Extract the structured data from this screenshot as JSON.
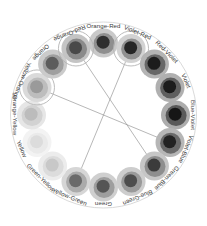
{
  "widget": {
    "name": "color-wheel",
    "type": "grayscale-color-harmony-wheel",
    "background": "#ffffff",
    "center": {
      "x": 103.5,
      "y": 115
    },
    "outer_ring_radius": 93,
    "swatch_ring_radius": 72,
    "label_radius": 89,
    "swatch_outer_radius": 14.5,
    "swatch_mid_radius": 10.5,
    "swatch_inner_radius": 6.5,
    "selection_ring_radius": 17.5,
    "selection_ring_color": "#b4b4b4",
    "outer_ring_color": "#cfcfcf",
    "connector_color": "#8a8a8a"
  },
  "swatches": [
    {
      "label": "Orange-Red",
      "angle": -90,
      "outer": "#c9c9c9",
      "mid": "#8f8f8f",
      "inner": "#2e2e2e",
      "selected": false
    },
    {
      "label": "Violet-Red",
      "angle": -67.5,
      "outer": "#d2d2d2",
      "mid": "#909090",
      "inner": "#252525",
      "selected": true
    },
    {
      "label": "Red-Violet",
      "angle": -45,
      "outer": "#b4b4b4",
      "mid": "#686868",
      "inner": "#1f1f1f",
      "selected": false
    },
    {
      "label": "Violet",
      "angle": -22.5,
      "outer": "#b0b0b0",
      "mid": "#5e5e5e",
      "inner": "#1a1a1a",
      "selected": false
    },
    {
      "label": "Blue-Violet",
      "angle": 0,
      "outer": "#adadad",
      "mid": "#5a5a5a",
      "inner": "#171717",
      "selected": false
    },
    {
      "label": "Violet-Blue",
      "angle": 22.5,
      "outer": "#b6b6b6",
      "mid": "#6b6b6b",
      "inner": "#202020",
      "selected": false
    },
    {
      "label": "Green-Blue",
      "angle": 45,
      "outer": "#c6c6c6",
      "mid": "#8e8e8e",
      "inner": "#3b3b3b",
      "selected": false
    },
    {
      "label": "Blue-Green",
      "angle": 67.5,
      "outer": "#cdcdcd",
      "mid": "#9a9a9a",
      "inner": "#4e4e4e",
      "selected": false
    },
    {
      "label": "Green",
      "angle": 90,
      "outer": "#cfcfcf",
      "mid": "#9e9e9e",
      "inner": "#555555",
      "selected": false
    },
    {
      "label": "Yellow-Green",
      "angle": 112.5,
      "outer": "#d6d6d6",
      "mid": "#ababab",
      "inner": "#6a6a6a",
      "selected": false
    },
    {
      "label": "Green-Yellow",
      "angle": 135,
      "outer": "#ececec",
      "mid": "#dcdcdc",
      "inner": "#c8c8c8",
      "selected": false
    },
    {
      "label": "Yellow",
      "angle": 157.5,
      "outer": "#f3f3f3",
      "mid": "#eaeaea",
      "inner": "#dcdcdc",
      "selected": false
    },
    {
      "label": "Orange-Yellow",
      "angle": 180,
      "outer": "#e6e6e6",
      "mid": "#d2d2d2",
      "inner": "#bcbcbc",
      "selected": false
    },
    {
      "label": "Yellow-Orange",
      "angle": -157.5,
      "outer": "#dadada",
      "mid": "#bdbdbd",
      "inner": "#9a9a9a",
      "selected": true
    },
    {
      "label": "Orange",
      "angle": -135,
      "outer": "#cbcbcb",
      "mid": "#9f9f9f",
      "inner": "#5c5c5c",
      "selected": false
    },
    {
      "label": "Red-Orange",
      "angle": -112.5,
      "outer": "#c4c4c4",
      "mid": "#8a8a8a",
      "inner": "#4a4a4a",
      "selected": true
    }
  ],
  "connections": [
    {
      "from": "Red-Orange",
      "to": "Green-Blue"
    },
    {
      "from": "Violet-Red",
      "to": "Yellow-Green"
    },
    {
      "from": "Yellow-Orange",
      "to": "Violet-Blue"
    },
    {
      "from": "Red-Orange",
      "to": "Yellow-Orange"
    }
  ]
}
